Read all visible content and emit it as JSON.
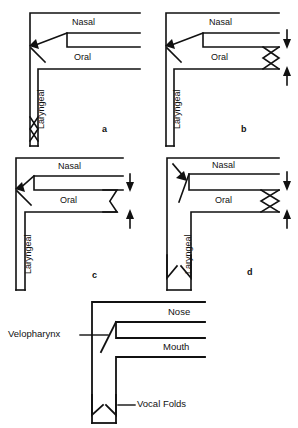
{
  "figure": {
    "stroke_color": "#111111",
    "background_color": "#ffffff"
  },
  "panels": [
    {
      "id": "a",
      "caption": "a",
      "cavities": {
        "nasal": "Nasal",
        "oral": "Oral",
        "laryngeal": "Laryngeal"
      },
      "velum": {
        "state": "open",
        "arrow": "up-left"
      },
      "lips": {
        "state": "open-no-valve",
        "arrows": []
      },
      "glottis": {
        "state": "closed-bowtie"
      }
    },
    {
      "id": "b",
      "caption": "b",
      "cavities": {
        "nasal": "Nasal",
        "oral": "Oral",
        "laryngeal": "Laryngeal"
      },
      "velum": {
        "state": "open",
        "arrow": "up-left"
      },
      "lips": {
        "state": "closed-bowtie",
        "arrows": [
          "down",
          "up"
        ]
      },
      "glottis": {
        "state": "open-empty"
      }
    },
    {
      "id": "c",
      "caption": "c",
      "cavities": {
        "nasal": "Nasal",
        "oral": "Oral",
        "laryngeal": "Laryngeal"
      },
      "velum": {
        "state": "open",
        "arrow": "up-left"
      },
      "lips": {
        "state": "open-split-triangles",
        "arrows": [
          "down",
          "up"
        ]
      },
      "glottis": {
        "state": "open-empty"
      }
    },
    {
      "id": "d",
      "caption": "d",
      "cavities": {
        "nasal": "Nasal",
        "oral": "Oral",
        "laryngeal": "Laryngeal"
      },
      "velum": {
        "state": "closed",
        "arrow": "down-right"
      },
      "lips": {
        "state": "closed-bowtie",
        "arrows": [
          "down",
          "up"
        ]
      },
      "glottis": {
        "state": "open-split-triangles"
      }
    }
  ],
  "legend_panel": {
    "labels": {
      "velopharynx": "Velopharynx",
      "nose": "Nose",
      "mouth": "Mouth",
      "vocal_folds": "Vocal Folds"
    },
    "velum": {
      "state": "open"
    },
    "glottis": {
      "state": "open-split-triangles"
    }
  }
}
